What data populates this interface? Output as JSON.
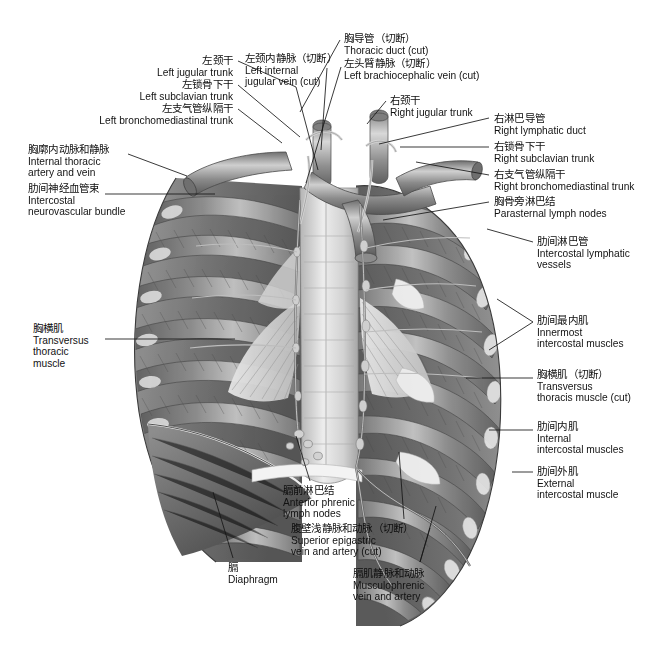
{
  "figure": {
    "background_color": "#ffffff",
    "line_color": "#171717",
    "width": 669,
    "height": 667
  },
  "labels": [
    {
      "id": "left-jugular-trunk",
      "cn": "左颈干",
      "en": "Left jugular trunk",
      "align": "right",
      "x": 233,
      "y": 55
    },
    {
      "id": "left-subclavian-trunk",
      "cn": "左锁骨下干",
      "en": "Left subclavian trunk",
      "align": "right",
      "x": 233,
      "y": 79
    },
    {
      "id": "left-bronchomediastinal-trunk",
      "cn": "左支气管纵隔干",
      "en": "Left bronchomediastinal trunk",
      "align": "right",
      "x": 233,
      "y": 103
    },
    {
      "id": "internal-thoracic-artery-and-vein",
      "cn": "胸廓内动脉和静脉",
      "en": "Internal thoracic\nartery and vein",
      "align": "left",
      "x": 28,
      "y": 144
    },
    {
      "id": "intercostal-neurovascular-bundle",
      "cn": "肋间神经血管束",
      "en": "Intercostal\nneurovascular bundle",
      "align": "left",
      "x": 28,
      "y": 183
    },
    {
      "id": "transversus-thoracis-muscle",
      "cn": "胸横肌",
      "en": "Transversus\nthoracic\nmuscle",
      "align": "left",
      "x": 33,
      "y": 323
    },
    {
      "id": "left-internal-jugular-vein-cut",
      "cn": "左颈内静脉（切断）",
      "en": "Left internal\njugular vein (cut)",
      "align": "left",
      "x": 245,
      "y": 53
    },
    {
      "id": "thoracic-duct-cut",
      "cn": "胸导管（切断）",
      "en": "Thoracic duct (cut)",
      "align": "left",
      "x": 344,
      "y": 33
    },
    {
      "id": "left-brachiocephalic-vein-cut",
      "cn": "左头臂静脉（切断）",
      "en": "Left brachiocephalic vein (cut)",
      "align": "left",
      "x": 344,
      "y": 58
    },
    {
      "id": "right-jugular-trunk",
      "cn": "右颈干",
      "en": "Right jugular trunk",
      "align": "left",
      "x": 390,
      "y": 95
    },
    {
      "id": "right-lymphatic-duct",
      "cn": "右淋巴导管",
      "en": "Right lymphatic duct",
      "align": "left",
      "x": 494,
      "y": 113
    },
    {
      "id": "right-subclavian-trunk",
      "cn": "右锁骨下干",
      "en": "Right subclavian trunk",
      "align": "left",
      "x": 494,
      "y": 141
    },
    {
      "id": "right-bronchomediastinal-trunk",
      "cn": "右支气管纵隔干",
      "en": "Right bronchomediastinal trunk",
      "align": "left",
      "x": 494,
      "y": 169
    },
    {
      "id": "parasternal-lymph-nodes",
      "cn": "胸骨旁淋巴结",
      "en": "Parasternal lymph nodes",
      "align": "left",
      "x": 494,
      "y": 196
    },
    {
      "id": "intercostal-lymphatic-vessels",
      "cn": "肋间淋巴管",
      "en": "Intercostal lymphatic\nvessels",
      "align": "left",
      "x": 537,
      "y": 236
    },
    {
      "id": "innermost-intercostal-muscles",
      "cn": "肋间最内肌",
      "en": "Innermost\nintercostal muscles",
      "align": "left",
      "x": 537,
      "y": 315
    },
    {
      "id": "transversus-thoracis-muscle-cut",
      "cn": "胸横肌（切断）",
      "en": "Transversus\nthoracis muscle (cut)",
      "align": "left",
      "x": 537,
      "y": 369
    },
    {
      "id": "internal-intercostal-muscles",
      "cn": "肋间内肌",
      "en": "Internal\nintercostal muscles",
      "align": "left",
      "x": 537,
      "y": 421
    },
    {
      "id": "external-intercostal-muscle",
      "cn": "肋间外肌",
      "en": "External\nintercostal muscle",
      "align": "left",
      "x": 537,
      "y": 466
    },
    {
      "id": "anterior-phrenic-lymph-nodes",
      "cn": "膈前淋巴结",
      "en": "Anterior phrenic\nlymph nodes",
      "align": "left",
      "x": 283,
      "y": 485
    },
    {
      "id": "superior-epigastric-vein-and-artery-cut",
      "cn": "腹壁浅静脉和动脉（切断）",
      "en": "Superior epigastric\nvein and artery (cut)",
      "align": "left",
      "x": 291,
      "y": 523
    },
    {
      "id": "diaphragm",
      "cn": "膈",
      "en": "Diaphragm",
      "align": "left",
      "x": 228,
      "y": 562
    },
    {
      "id": "musculophrenic-vein-and-artery",
      "cn": "膈肌静脉和动脉",
      "en": "Musculophrenic\nvein and artery",
      "align": "left",
      "x": 353,
      "y": 568
    }
  ],
  "leaders": [
    {
      "id": "leader-left-jugular-trunk",
      "points": "238,61 296,87 296,87 318,170"
    },
    {
      "id": "leader-left-subclavian-trunk",
      "points": "238,85 300,137"
    },
    {
      "id": "leader-left-bronchomediastinal-trunk",
      "points": "238,109 282,143"
    },
    {
      "id": "leader-internal-thoracic-artery-and-vein",
      "points": "128,154 187,176"
    },
    {
      "id": "leader-intercostal-neurovascular-bundle",
      "points": "105,194 215,194"
    },
    {
      "id": "leader-transversus-thoracis-muscle",
      "points": "105,339 235,339"
    },
    {
      "id": "leader-left-internal-jugular-vein-cut",
      "points": "327,68 321,150"
    },
    {
      "id": "leader-thoracic-duct-cut",
      "points": "340,40 300,112"
    },
    {
      "id": "leader-left-brachiocephalic-vein-cut",
      "points": "341,67 306,183"
    },
    {
      "id": "leader-right-jugular-trunk",
      "points": "386,101 367,124"
    },
    {
      "id": "leader-right-lymphatic-duct",
      "points": "489,118 379,144"
    },
    {
      "id": "leader-right-subclavian-trunk",
      "points": "489,147 400,147"
    },
    {
      "id": "leader-right-bronchomediastinal-trunk",
      "points": "489,175 416,162"
    },
    {
      "id": "leader-parasternal-lymph-nodes",
      "points": "489,202 383,220"
    },
    {
      "id": "leader-intercostal-lymphatic-vessels",
      "points": "533,242 487,229"
    },
    {
      "id": "leader-innermost-intercostal-muscles-a",
      "points": "533,322 497,299"
    },
    {
      "id": "leader-innermost-intercostal-muscles-b",
      "points": "533,322 489,350"
    },
    {
      "id": "leader-transversus-thoracis-muscle-cut",
      "points": "533,378 466,378"
    },
    {
      "id": "leader-internal-intercostal-muscles",
      "points": "533,430 489,430"
    },
    {
      "id": "leader-external-intercostal-muscle",
      "points": "533,472 512,472"
    },
    {
      "id": "leader-anterior-phrenic-lymph-nodes",
      "points": "310,481 296,436"
    },
    {
      "id": "leader-superior-epigastric-vein-and-artery-cut",
      "points": "404,519 399,452"
    },
    {
      "id": "leader-diaphragm",
      "points": "233,558 213,492"
    },
    {
      "id": "leader-musculophrenic-vein-and-artery-a",
      "points": "420,562 436,506"
    },
    {
      "id": "leader-musculophrenic-vein-and-artery-b",
      "points": "420,562 430,528"
    }
  ]
}
